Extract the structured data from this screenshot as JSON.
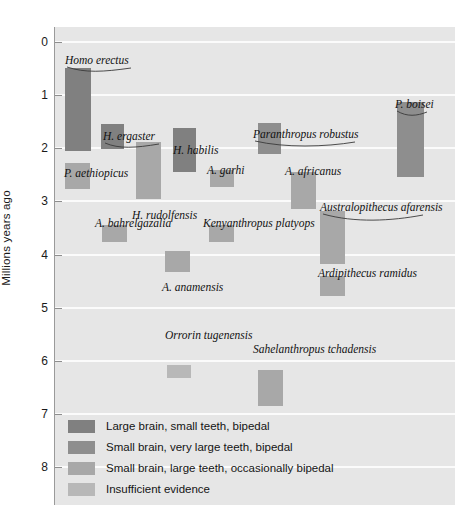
{
  "chart_data": {
    "type": "bar",
    "orientation": "vertical-ranges",
    "title": "",
    "xlabel": "",
    "ylabel": "Millions years ago",
    "ylim": [
      0,
      8.7
    ],
    "y_inverted": true,
    "yticks": [
      0,
      1,
      2,
      3,
      4,
      5,
      6,
      7,
      8
    ],
    "ytick_labels": [
      "0",
      "1",
      "2",
      "3",
      "4",
      "5",
      "6",
      "7",
      "8"
    ],
    "grid": true,
    "grid_color": "#fbfbfb",
    "plot_background": "#e6e6e6",
    "legend_position": "bottom-left",
    "categories": [
      "Homo erectus",
      "H. ergaster",
      "H. habilis",
      "Paranthropus robustus",
      "P. boisei",
      "P. aethiopicus",
      "H. rudolfensis",
      "A. garhi",
      "A. africanus",
      "A. bahrelgazalia",
      "Kenyanthropus platyops",
      "Australopithecus afarensis",
      "A. anamensis",
      "Ardipithecus ramidus",
      "Orrorin tugenensis",
      "Sahelanthropus tchadensis"
    ],
    "series": [
      {
        "name": "Large brain, small teeth, bipedal",
        "color": "#808080",
        "bars": [
          {
            "label": "Homo erectus",
            "start_mya": 0.48,
            "end_mya": 2.06
          },
          {
            "label": "H. ergaster",
            "start_mya": 1.54,
            "end_mya": 2.02
          },
          {
            "label": "H. habilis",
            "start_mya": 1.62,
            "end_mya": 2.45
          }
        ]
      },
      {
        "name": "Small brain, very large teeth, bipedal",
        "color": "#8e8e8e",
        "bars": [
          {
            "label": "Paranthropus robustus",
            "start_mya": 1.52,
            "end_mya": 2.1
          },
          {
            "label": "P. boisei",
            "start_mya": 1.13,
            "end_mya": 2.55
          }
        ]
      },
      {
        "name": "Small brain, large teeth, occasionally bipedal",
        "color": "#a8a8a8",
        "bars": [
          {
            "label": "P. aethiopicus",
            "start_mya": 2.28,
            "end_mya": 2.76
          },
          {
            "label": "H. rudolfensis",
            "start_mya": 1.89,
            "end_mya": 2.96
          },
          {
            "label": "A. garhi",
            "start_mya": 2.4,
            "end_mya": 2.72
          },
          {
            "label": "A. africanus",
            "start_mya": 2.44,
            "end_mya": 3.14
          },
          {
            "label": "A. bahrelgazalia",
            "start_mya": 3.44,
            "end_mya": 3.77
          },
          {
            "label": "Kenyanthropus platyops",
            "start_mya": 3.44,
            "end_mya": 3.77
          },
          {
            "label": "Australopithecus afarensis",
            "start_mya": 3.18,
            "end_mya": 4.17
          },
          {
            "label": "A. anamensis",
            "start_mya": 3.94,
            "end_mya": 4.33
          },
          {
            "label": "Ardipithecus ramidus",
            "start_mya": 4.4,
            "end_mya": 4.78
          },
          {
            "label": "Sahelanthropus tchadensis",
            "start_mya": 6.18,
            "end_mya": 6.86
          }
        ]
      },
      {
        "name": "Insufficient evidence",
        "color": "#b8b8b8",
        "bars": [
          {
            "label": "Orrorin tugenensis",
            "start_mya": 6.08,
            "end_mya": 6.32
          }
        ]
      }
    ]
  },
  "axis": {
    "title": "Millions years ago",
    "ticks": [
      "0",
      "1",
      "2",
      "3",
      "4",
      "5",
      "6",
      "7",
      "8"
    ]
  },
  "labels": {
    "homo_erectus": "Homo erectus",
    "h_ergaster": "H. ergaster",
    "h_habilis": "H. habilis",
    "p_robustus": "Paranthropus robustus",
    "p_boisei": "P. boisei",
    "p_aethiopicus": "P. aethiopicus",
    "h_rudolfensis": "H. rudolfensis",
    "a_garhi": "A. garhi",
    "a_africanus": "A. africanus",
    "a_bahrelgazalia": "A. bahrelgazalia",
    "k_platyops": "Kenyanthropus platyops",
    "a_afarensis": "Australopithecus afarensis",
    "a_anamensis": "A. anamensis",
    "ar_ramidus": "Ardipithecus ramidus",
    "o_tugenensis": "Orrorin tugenensis",
    "s_tchadensis": "Sahelanthropus tchadensis"
  },
  "legend": {
    "items": [
      {
        "label": "Large brain, small teeth, bipedal",
        "color": "#808080"
      },
      {
        "label": "Small brain, very large teeth, bipedal",
        "color": "#8e8e8e"
      },
      {
        "label": "Small brain, large teeth, occasionally bipedal",
        "color": "#a8a8a8"
      },
      {
        "label": "Insufficient evidence",
        "color": "#b8b8b8"
      }
    ]
  }
}
